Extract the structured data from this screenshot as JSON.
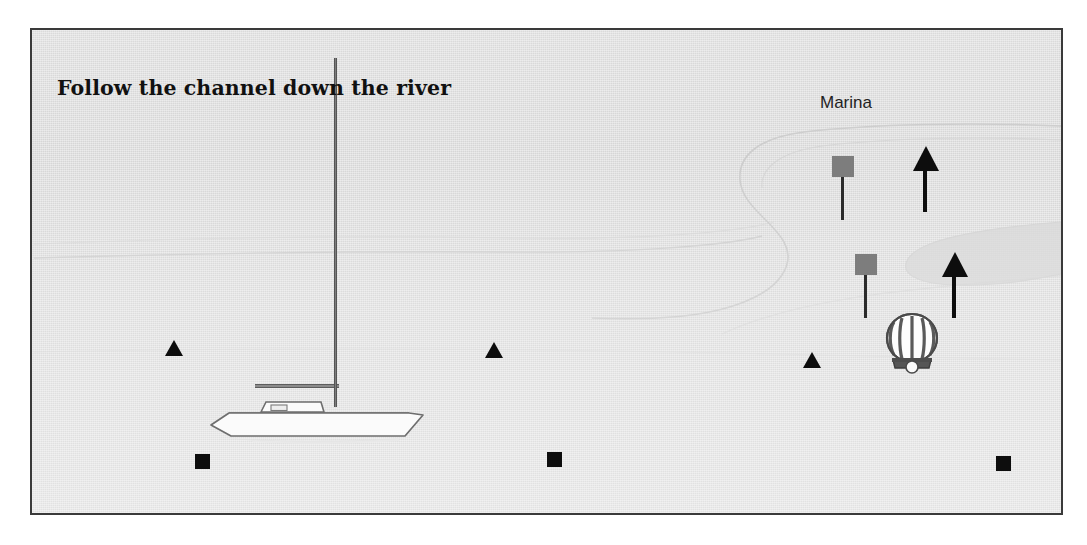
{
  "scene": {
    "title": "Follow the channel down the river",
    "panel_background_color": "#dcdcdc",
    "panel_border_color": "#3a3a3a",
    "page_background_color": "#ffffff"
  },
  "labels": {
    "marina": "Marina"
  },
  "colors": {
    "marker_black": "#0d0d0d",
    "flag_gray": "#7d7d7d",
    "pole_dark": "#2b2b2b",
    "hull_white": "#fbfbfb",
    "hull_outline": "#6e6e6e",
    "mast_gray": "#7d7d7d",
    "channel_line": "#cfcfcf",
    "title_color": "#111111",
    "label_color": "#1f1f1f"
  },
  "markers": {
    "triangles": [
      {
        "name": "navigation-triangle-left",
        "x": 133,
        "y": 340
      },
      {
        "name": "navigation-triangle-center",
        "x": 453,
        "y": 342
      },
      {
        "name": "navigation-triangle-right",
        "x": 771,
        "y": 352
      }
    ],
    "squares": [
      {
        "name": "navigation-square-left",
        "x": 163,
        "y": 454
      },
      {
        "name": "navigation-square-center",
        "x": 515,
        "y": 452
      },
      {
        "name": "navigation-square-right",
        "x": 964,
        "y": 456
      }
    ],
    "flags": [
      {
        "name": "marina-flag-upper",
        "x": 800,
        "y": 156
      },
      {
        "name": "marina-flag-lower",
        "x": 823,
        "y": 254
      }
    ],
    "arrows": [
      {
        "name": "channel-arrow-upper",
        "x": 881,
        "y": 146
      },
      {
        "name": "channel-arrow-lower",
        "x": 910,
        "y": 252
      }
    ],
    "buoy": {
      "name": "striped-balloon-buoy",
      "x": 851,
      "y": 312,
      "stripes": 7
    }
  },
  "vessel": {
    "name": "sailboat",
    "hull_label": "boat-hull",
    "mast_label": "boat-mast",
    "boom_label": "boat-boom",
    "cabin_label": "boat-cabin"
  }
}
